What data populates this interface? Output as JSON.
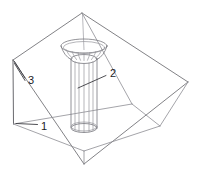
{
  "figure": {
    "type": "technical-line-drawing",
    "background_color": "#ffffff",
    "line_color": "#6b6b70",
    "label_color": "#1b1b1f"
  },
  "callouts": [
    {
      "id": "callout-1",
      "label": "1",
      "text_x": 41,
      "text_y": 127,
      "leader": "M 37.5 124.5 L 16 123.5",
      "target": "lower-left corner of vessel",
      "leader_style": "horizontal"
    },
    {
      "id": "callout-2",
      "label": "2",
      "text_x": 110,
      "text_y": 74,
      "leader": "M 106 75.5 L 78 88",
      "target": "central vertical pipe",
      "leader_style": "diagonal"
    },
    {
      "id": "callout-3",
      "label": "3",
      "text_x": 28,
      "text_y": 81,
      "leader_a": "M 25 78 L 14.5 61.5",
      "leader_b": "M 25 80.5 L 14.5 63",
      "target": "vessel wall / upper-left corner",
      "leader_style": "double-branch"
    }
  ],
  "geometry": {
    "vessel": {
      "top_rim": [
        [
          82,
          13
        ],
        [
          188,
          82
        ],
        [
          84,
          164
        ],
        [
          13,
          60
        ]
      ],
      "left_wall_bottom_left": [
        13,
        124
      ],
      "left_wall_note": "left face drops vertically from rim corner",
      "inner_floor": [
        [
          13,
          124
        ],
        [
          132,
          104
        ],
        [
          160,
          126
        ],
        [
          84,
          151
        ]
      ]
    },
    "pipe": {
      "center_x": 84,
      "top_y": 55,
      "bottom_y": 128,
      "radius_x": 13,
      "radius_y": 4.5,
      "rib_count": 7
    },
    "funnel": {
      "center_x": 84,
      "mouth_y": 46,
      "mouth_radius_x": 23,
      "mouth_radius_y": 7,
      "throat_y": 60,
      "rib_count": 9
    },
    "axis": {
      "from": [
        82,
        14
      ],
      "to": [
        84,
        50
      ]
    }
  }
}
